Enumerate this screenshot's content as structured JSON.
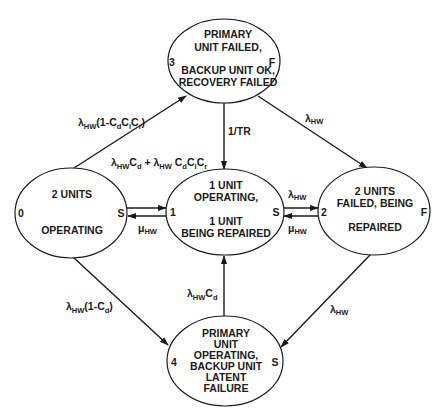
{
  "diagram": {
    "type": "markov-state-transition",
    "colors": {
      "stroke": "#1a1a1a",
      "background": "#ffffff"
    },
    "states": [
      {
        "id": "0",
        "number_label": "0",
        "type_label": "S",
        "lines": [
          "2 UNITS",
          "",
          "OPERATING"
        ]
      },
      {
        "id": "1",
        "number_label": "1",
        "type_label": "S",
        "lines": [
          "1 UNIT",
          "OPERATING,",
          "",
          "1 UNIT",
          "BEING REPAIRED"
        ]
      },
      {
        "id": "2",
        "number_label": "2",
        "type_label": "F",
        "lines": [
          "2 UNITS",
          "FAILED, BEING",
          "",
          "REPAIRED"
        ]
      },
      {
        "id": "3",
        "number_label": "3",
        "type_label": "F",
        "lines": [
          "PRIMARY",
          "UNIT FAILED,",
          "",
          "BACKUP UNIT OK,",
          "RECOVERY FAILED"
        ]
      },
      {
        "id": "4",
        "number_label": "4",
        "type_label": "S",
        "lines": [
          "PRIMARY",
          "UNIT",
          "OPERATING,",
          "BACKUP UNIT",
          "LATENT",
          "FAILURE"
        ]
      }
    ],
    "transitions": [
      {
        "from": "0",
        "to": "3",
        "rate": {
          "sym": "λ",
          "sub": "HW",
          "rest": "(1-C",
          "rest_sub1": "d",
          "rest2": "C",
          "rest_sub2": "i",
          "rest3": "C",
          "rest_sub3": "r",
          "rest4": ")"
        }
      },
      {
        "from": "0",
        "to": "1",
        "rate": {
          "sym": "λ",
          "sub": "HW",
          "t1": "C",
          "t1sub": "d",
          "plus": " + ",
          "sym2": "λ",
          "sub2": "HW",
          "t2": " C",
          "t2sub": "d",
          "t3": "C",
          "t3sub": "i",
          "t4": "C",
          "t4sub": "r"
        }
      },
      {
        "from": "1",
        "to": "0",
        "rate": {
          "sym": "μ",
          "sub": "HW"
        }
      },
      {
        "from": "3",
        "to": "1",
        "rate": {
          "text": "1/TR"
        }
      },
      {
        "from": "3",
        "to": "2",
        "rate": {
          "sym": "λ",
          "sub": "HW"
        }
      },
      {
        "from": "1",
        "to": "2",
        "rate": {
          "sym": "λ",
          "sub": "HW"
        }
      },
      {
        "from": "2",
        "to": "1",
        "rate": {
          "sym": "μ",
          "sub": "HW"
        }
      },
      {
        "from": "0",
        "to": "4",
        "rate": {
          "sym": "λ",
          "sub": "HW",
          "rest": "(1-C",
          "rest_sub1": "d",
          "rest4": ")"
        }
      },
      {
        "from": "4",
        "to": "1",
        "rate": {
          "sym": "λ",
          "sub": "HW",
          "t1": "C",
          "t1sub": "d"
        }
      },
      {
        "from": "2",
        "to": "4",
        "rate": {
          "sym": "λ",
          "sub": "HW"
        }
      }
    ]
  }
}
